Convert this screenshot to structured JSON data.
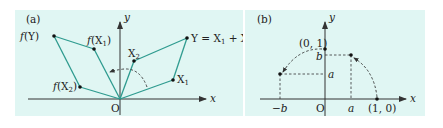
{
  "colors": {
    "panel_background": "#e0f6f3",
    "vector_line": "#2e9b8f",
    "axis": "#333333",
    "text": "#222222"
  },
  "panel_a": {
    "label": "(a)",
    "x_axis_label": "x",
    "y_axis_label": "y",
    "origin_label": "O",
    "points": {
      "f_Y": {
        "label_f": "f",
        "label_arg": "(Y)"
      },
      "f_X1": {
        "label_f": "f",
        "label_arg": "(X",
        "label_sub": "1",
        "label_close": ")"
      },
      "f_X2": {
        "label_f": "f",
        "label_arg": "(X",
        "label_sub": "2",
        "label_close": ")"
      },
      "X1": {
        "label": "X",
        "sub": "1"
      },
      "X2": {
        "label": "X",
        "sub": "2"
      },
      "Y": {
        "label_lhs": "Y = X",
        "sub1": "1",
        "plus": " + X",
        "sub2": "2"
      }
    }
  },
  "panel_b": {
    "label": "(b)",
    "x_axis_label": "x",
    "y_axis_label": "y",
    "origin_label": "O",
    "tick_labels": {
      "point_0_1": "(0, 1)",
      "point_1_0": "(1, 0)",
      "y_b": "b",
      "y_a": "a",
      "x_a": "a",
      "x_neg_b": "−b"
    }
  }
}
